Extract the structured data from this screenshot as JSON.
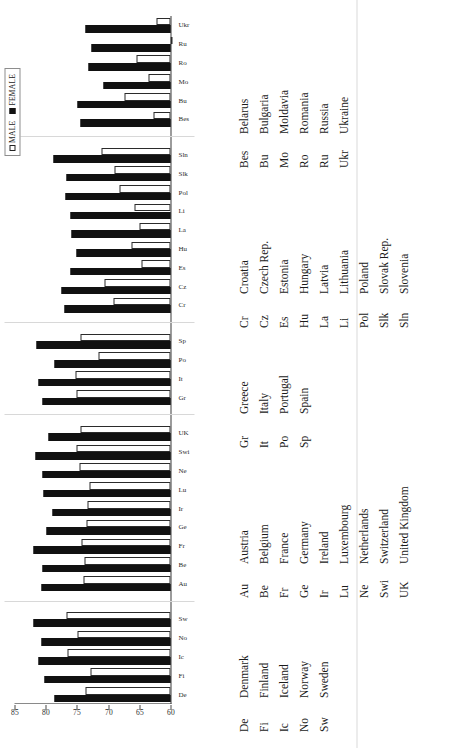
{
  "figure": {
    "orientation": "rotated-90-ccw",
    "legend": {
      "male_label": "MALE",
      "female_label": "FEMALE",
      "male_swatch": "hollow-square",
      "female_swatch": "filled-square"
    }
  },
  "chart_data": {
    "type": "bar",
    "title": "",
    "subtitle": "",
    "xlabel": "",
    "ylabel": "",
    "ylim": [
      60,
      85
    ],
    "yticks": [
      60,
      65,
      70,
      75,
      80,
      85
    ],
    "ytick_labels": [
      "60",
      "65",
      "70",
      "75",
      "80",
      "85"
    ],
    "grid": false,
    "legend_position": "top-right",
    "orientation": "vertical-bars-printed-sideways",
    "categories": [
      "De",
      "Fi",
      "Ic",
      "No",
      "Sw",
      "Au",
      "Be",
      "Fr",
      "Ge",
      "Ir",
      "Lu",
      "Ne",
      "Swi",
      "UK",
      "Gr",
      "It",
      "Po",
      "Sp",
      "Cr",
      "Cz",
      "Es",
      "Hu",
      "La",
      "Li",
      "Pol",
      "Slk",
      "Sln",
      "Bes",
      "Bu",
      "Mo",
      "Ro",
      "Ru",
      "Ukr"
    ],
    "series": [
      {
        "name": "MALE",
        "color": "#ffffff",
        "values": [
          73.6,
          72.8,
          76.5,
          74.9,
          76.6,
          74.0,
          73.8,
          74.2,
          73.5,
          73.3,
          73.0,
          74.6,
          75.1,
          74.5,
          75.1,
          75.3,
          71.6,
          74.4,
          69.2,
          70.5,
          64.7,
          66.3,
          64.9,
          65.8,
          68.2,
          69.0,
          71.1,
          62.8,
          67.4,
          63.5,
          65.5,
          59.9,
          62.3
        ]
      },
      {
        "name": "FEMALE",
        "color": "#111111",
        "values": [
          78.6,
          80.2,
          81.1,
          80.7,
          81.9,
          80.7,
          80.5,
          82.0,
          79.9,
          78.9,
          80.3,
          80.5,
          81.6,
          79.6,
          80.5,
          81.2,
          78.6,
          81.5,
          77.0,
          77.4,
          76.0,
          75.0,
          75.8,
          76.1,
          76.8,
          76.7,
          78.7,
          74.4,
          74.9,
          70.8,
          73.1,
          72.6,
          73.6
        ]
      }
    ]
  },
  "key": {
    "columns": [
      {
        "rows": [
          {
            "abbr": "De",
            "name": "Denmark"
          },
          {
            "abbr": "Fi",
            "name": "Finland"
          },
          {
            "abbr": "Ic",
            "name": "Iceland"
          },
          {
            "abbr": "No",
            "name": "Norway"
          },
          {
            "abbr": "Sw",
            "name": "Sweden"
          }
        ]
      },
      {
        "rows": [
          {
            "abbr": "Au",
            "name": "Austria"
          },
          {
            "abbr": "Be",
            "name": "Belgium"
          },
          {
            "abbr": "Fr",
            "name": "France"
          },
          {
            "abbr": "Ge",
            "name": "Germany"
          },
          {
            "abbr": "Ir",
            "name": "Ireland"
          },
          {
            "abbr": "Lu",
            "name": "Luxembourg"
          },
          {
            "abbr": "Ne",
            "name": "Netherlands"
          },
          {
            "abbr": "Swi",
            "name": "Switzerland"
          },
          {
            "abbr": "UK",
            "name": "United Kingdom"
          }
        ]
      },
      {
        "rows": [
          {
            "abbr": "Gr",
            "name": "Greece"
          },
          {
            "abbr": "It",
            "name": "Italy"
          },
          {
            "abbr": "Po",
            "name": "Portugal"
          },
          {
            "abbr": "Sp",
            "name": "Spain"
          }
        ]
      },
      {
        "rows": [
          {
            "abbr": "Cr",
            "name": "Croatia"
          },
          {
            "abbr": "Cz",
            "name": "Czech Rep."
          },
          {
            "abbr": "Es",
            "name": "Estonia"
          },
          {
            "abbr": "Hu",
            "name": "Hungary"
          },
          {
            "abbr": "La",
            "name": "Latvia"
          },
          {
            "abbr": "Li",
            "name": "Lithuania"
          },
          {
            "abbr": "Pol",
            "name": "Poland"
          },
          {
            "abbr": "Slk",
            "name": "Slovak Rep."
          },
          {
            "abbr": "Sln",
            "name": "Slovenia"
          }
        ]
      },
      {
        "rows": [
          {
            "abbr": "Bes",
            "name": "Belarus"
          },
          {
            "abbr": "Bu",
            "name": "Bulgaria"
          },
          {
            "abbr": "Mo",
            "name": "Moldavia"
          },
          {
            "abbr": "Ro",
            "name": "Romania"
          },
          {
            "abbr": "Ru",
            "name": "Russia"
          },
          {
            "abbr": "Ukr",
            "name": "Ukraine"
          }
        ]
      }
    ]
  },
  "groups": [
    {
      "name": "nordic",
      "count": 5
    },
    {
      "name": "western",
      "count": 9
    },
    {
      "name": "southern",
      "count": 4
    },
    {
      "name": "central-eastern",
      "count": 9
    },
    {
      "name": "eastern",
      "count": 6
    }
  ]
}
